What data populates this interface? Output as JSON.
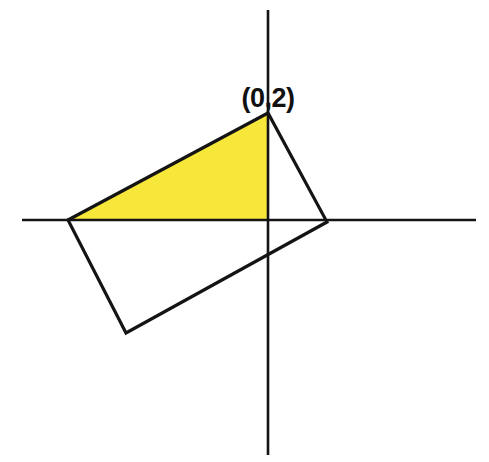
{
  "figure": {
    "background_color": "#FFFFFF",
    "line_color": "#141414",
    "fill_color": "#F8E73B",
    "labels": [
      {
        "name": "vertex-label-top",
        "text": "(0,2)",
        "x": 268,
        "y": 107,
        "anchor": "middle"
      }
    ]
  },
  "chart_data": {
    "type": "scatter",
    "xlabel": "",
    "ylabel": "",
    "grid": false,
    "legend": null,
    "axes": {
      "origin_px": {
        "x": 268,
        "y": 220
      },
      "x_axis": {
        "x1": 22,
        "y1": 220,
        "x2": 476,
        "y2": 220
      },
      "y_axis": {
        "x1": 268,
        "y1": 10,
        "x2": 268,
        "y2": 455
      }
    },
    "shapes": [
      {
        "name": "rectangle-outline",
        "kind": "polygon",
        "closed": true,
        "fill": "none",
        "stroke": "#141414",
        "points_px": [
          {
            "x": 68,
            "y": 220
          },
          {
            "x": 268,
            "y": 113
          },
          {
            "x": 327,
            "y": 222
          },
          {
            "x": 126,
            "y": 333
          }
        ]
      },
      {
        "name": "shaded-triangle",
        "kind": "polygon",
        "closed": true,
        "fill": "#F8E73B",
        "stroke": "none",
        "points_px": [
          {
            "x": 68,
            "y": 220
          },
          {
            "x": 268,
            "y": 113
          },
          {
            "x": 268,
            "y": 220
          }
        ]
      }
    ],
    "annotations": [
      {
        "text": "(0,2)",
        "x_px": 268,
        "y_px": 107,
        "points_to_px": {
          "x": 268,
          "y": 113
        }
      }
    ],
    "points": [
      {
        "label": "(0,2)",
        "x_px": 268,
        "y_px": 113
      }
    ]
  }
}
